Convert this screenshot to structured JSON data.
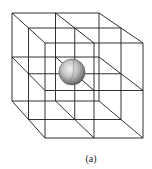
{
  "figure": {
    "caption": "(a)",
    "line_color": "#1a1a1a",
    "sphere_color": "#9a9a9a",
    "planes": [
      {
        "x0": 12,
        "x1": 99,
        "y0": 13,
        "y1": 101
      },
      {
        "x0": 28.5,
        "x1": 121,
        "y0": 28,
        "y1": 119.5
      },
      {
        "x0": 45,
        "x1": 143,
        "y0": 43,
        "y1": 138
      }
    ],
    "sphere": {
      "cx": 72,
      "cy": 72,
      "r": 13
    }
  }
}
